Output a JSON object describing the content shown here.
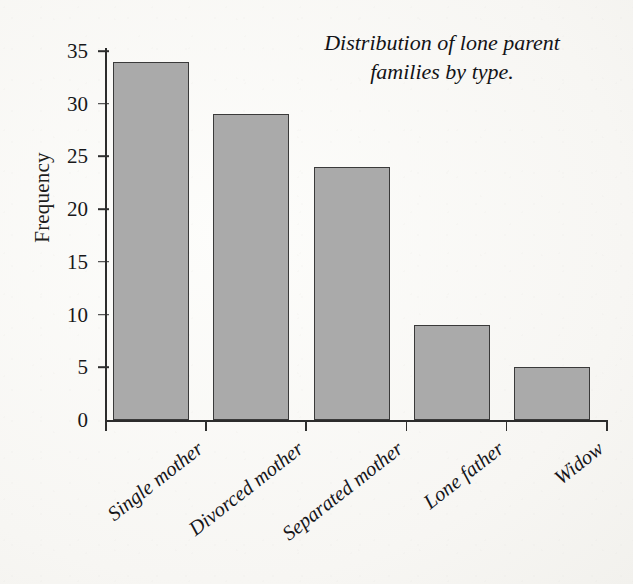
{
  "chart_data": {
    "type": "bar",
    "title": "Distribution of lone parent families by type.",
    "title_line1": "Distribution of lone parent",
    "title_line2": "families by type.",
    "xlabel": "",
    "ylabel": "Frequency",
    "categories": [
      "Single mother",
      "Divorced mother",
      "Separated mother",
      "Lone father",
      "Widow"
    ],
    "values": [
      34,
      29,
      24,
      9,
      5
    ],
    "ylim": [
      0,
      35
    ],
    "ytick_labels": [
      "0",
      "5",
      "10",
      "15",
      "20",
      "25",
      "30",
      "35"
    ],
    "ytick_values": [
      0,
      5,
      10,
      15,
      20,
      25,
      30,
      35
    ],
    "grid": false,
    "legend": false,
    "bar_color": "#aaaaaa",
    "bar_edge_color": "#3a3a3a",
    "axis_color": "#2c2c2c",
    "background_color": "#f7f6f3",
    "text_color": "#16161a"
  }
}
